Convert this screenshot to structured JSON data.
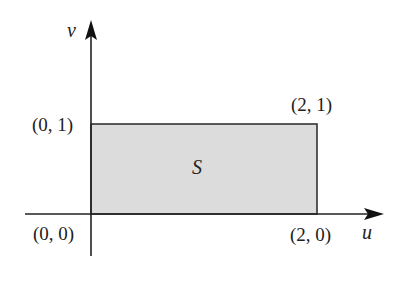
{
  "diagram": {
    "type": "coordinate-plane-region",
    "axes": {
      "horizontal": {
        "label": "u"
      },
      "vertical": {
        "label": "v"
      }
    },
    "region": {
      "label": "S",
      "shape": "rectangle",
      "fill_color": "#dcdcdc",
      "edge_color": "#333333",
      "vertices": [
        {
          "name": "origin",
          "label": "(0, 0)",
          "u": 0,
          "v": 0
        },
        {
          "name": "bottom-right",
          "label": "(2, 0)",
          "u": 2,
          "v": 0
        },
        {
          "name": "top-right",
          "label": "(2, 1)",
          "u": 2,
          "v": 1
        },
        {
          "name": "top-left",
          "label": "(0, 1)",
          "u": 0,
          "v": 1
        }
      ]
    },
    "colors": {
      "axis": "#222222",
      "background": "#ffffff"
    }
  }
}
